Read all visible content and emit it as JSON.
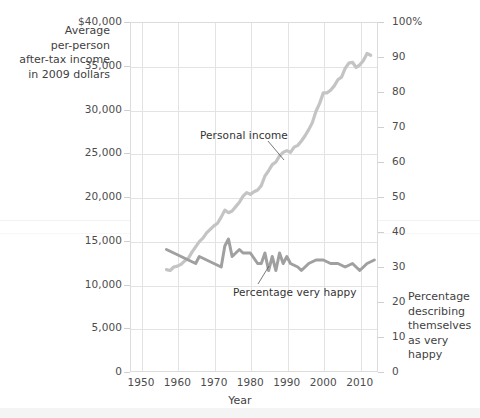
{
  "chart_data": {
    "type": "line",
    "title": "",
    "xlabel": "Year",
    "ylabel_left": "Average per-person after-tax income in 2009 dollars",
    "ylabel_right": "Percentage describing themselves as very happy",
    "xlim": [
      1947,
      2015
    ],
    "ylim_left": [
      0,
      40000
    ],
    "ylim_right": [
      0,
      100
    ],
    "grid": true,
    "legend_position": "inline-annotations",
    "x_ticks": [
      1950,
      1960,
      1970,
      1980,
      1990,
      2000,
      2010
    ],
    "y_ticks_left": [
      "0",
      "5,000",
      "10,000",
      "15,000",
      "20,000",
      "25,000",
      "30,000",
      "35,000",
      "$40,000"
    ],
    "y_ticks_right": [
      "0",
      "10",
      "20",
      "30",
      "40",
      "50",
      "60",
      "70",
      "80",
      "90",
      "100%"
    ],
    "series": [
      {
        "name": "Personal income",
        "axis": "left",
        "color": "#c4c4c4",
        "x": [
          1957,
          1958,
          1959,
          1960,
          1961,
          1962,
          1963,
          1964,
          1965,
          1966,
          1967,
          1968,
          1969,
          1970,
          1971,
          1972,
          1973,
          1974,
          1975,
          1976,
          1977,
          1978,
          1979,
          1980,
          1981,
          1982,
          1983,
          1984,
          1985,
          1986,
          1987,
          1988,
          1989,
          1990,
          1991,
          1992,
          1993,
          1994,
          1995,
          1996,
          1997,
          1998,
          1999,
          2000,
          2001,
          2002,
          2003,
          2004,
          2005,
          2006,
          2007,
          2008,
          2009,
          2010,
          2011,
          2012,
          2013
        ],
        "y": [
          11700,
          11600,
          12000,
          12100,
          12300,
          12700,
          13000,
          13700,
          14300,
          14900,
          15300,
          15900,
          16300,
          16700,
          17000,
          17700,
          18500,
          18200,
          18400,
          18900,
          19400,
          20100,
          20500,
          20300,
          20600,
          20800,
          21300,
          22400,
          23000,
          23700,
          24000,
          24700,
          25100,
          25300,
          25100,
          25700,
          25900,
          26400,
          27000,
          27700,
          28500,
          29800,
          30700,
          31900,
          31900,
          32200,
          32700,
          33400,
          33700,
          34700,
          35300,
          35400,
          34800,
          35100,
          35600,
          36400,
          36200
        ]
      },
      {
        "name": "Percentage very happy",
        "axis": "right",
        "color": "#a0a0a0",
        "x": [
          1957,
          1963,
          1965,
          1966,
          1972,
          1973,
          1974,
          1975,
          1976,
          1977,
          1978,
          1980,
          1982,
          1983,
          1984,
          1985,
          1986,
          1987,
          1988,
          1989,
          1990,
          1991,
          1993,
          1994,
          1996,
          1998,
          2000,
          2002,
          2004,
          2006,
          2008,
          2010,
          2012,
          2014
        ],
        "y": [
          35,
          32,
          31,
          33,
          30,
          36,
          38,
          33,
          34,
          35,
          34,
          34,
          31,
          31,
          34,
          29,
          33,
          29,
          34,
          31,
          33,
          31,
          30,
          29,
          31,
          32,
          32,
          31,
          31,
          30,
          31,
          29,
          31,
          32
        ]
      }
    ]
  },
  "annotations": {
    "income_label": "Personal income",
    "happy_label": "Percentage very happy"
  },
  "axes": {
    "x_title": "Year",
    "y_left_title_lines": [
      "Average",
      "per-person",
      "after-tax income",
      "in 2009 dollars"
    ],
    "y_right_title_lines": [
      "Percentage",
      "describing",
      "themselves",
      "as very happy"
    ]
  },
  "colors": {
    "income_line": "#c4c4c4",
    "happy_line": "#a0a0a0",
    "grid": "#e3e3e3",
    "frame": "#dcdcdc",
    "text": "#4c4c4c",
    "background": "#ffffff"
  }
}
